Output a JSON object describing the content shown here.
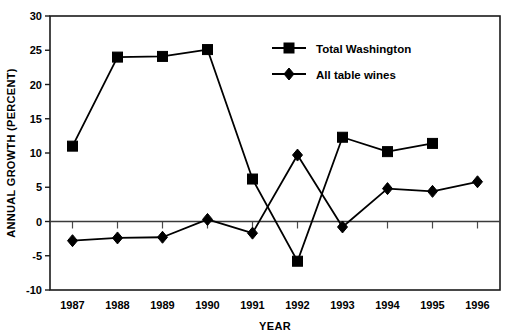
{
  "chart_data": {
    "type": "line",
    "title": "",
    "xlabel": "YEAR",
    "ylabel": "ANNUAL GROWTH (PERCENT)",
    "categories": [
      "1987",
      "1988",
      "1989",
      "1990",
      "1991",
      "1992",
      "1993",
      "1994",
      "1995",
      "1996"
    ],
    "x": [
      1987,
      1988,
      1989,
      1990,
      1991,
      1992,
      1993,
      1994,
      1995,
      1996
    ],
    "ylim": [
      -10,
      30
    ],
    "yticks": [
      -10,
      -5,
      0,
      5,
      10,
      15,
      20,
      25,
      30
    ],
    "ytick_labels": [
      "-10",
      "-5",
      "0",
      "5",
      "10",
      "15",
      "20",
      "25",
      "30"
    ],
    "grid": false,
    "zero_line": true,
    "legend_position": "top-center-right",
    "series": [
      {
        "name": "Total Washington",
        "marker": "square",
        "color": "#000000",
        "values": [
          11.0,
          24.0,
          24.1,
          25.1,
          6.2,
          -5.8,
          12.3,
          10.2,
          11.4,
          null
        ]
      },
      {
        "name": "All table wines",
        "marker": "diamond",
        "color": "#000000",
        "values": [
          -2.8,
          -2.4,
          -2.3,
          0.3,
          -1.7,
          9.7,
          -0.8,
          4.8,
          4.4,
          5.8
        ]
      }
    ]
  },
  "legend": {
    "items": [
      {
        "label": "Total Washington",
        "marker": "square"
      },
      {
        "label": "All table wines",
        "marker": "diamond"
      }
    ]
  },
  "axes": {
    "x_title": "YEAR",
    "y_title": "ANNUAL GROWTH (PERCENT)"
  }
}
